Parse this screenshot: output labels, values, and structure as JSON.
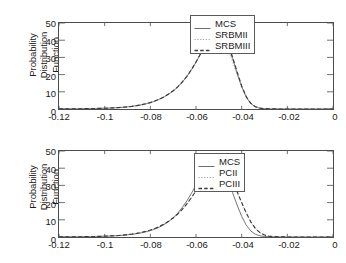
{
  "figure": {
    "background": "#ffffff",
    "axis_color": "#4d4d4d",
    "text_color": "#1a1a1a"
  },
  "chart_data": [
    {
      "id": "top",
      "type": "line",
      "title": "",
      "xlabel": "",
      "ylabel": "Probability Distribution\nFunction",
      "xlim": [
        -0.12,
        0
      ],
      "ylim": [
        0,
        50
      ],
      "grid": false,
      "legend_position": "upper right",
      "xticks": [
        -0.12,
        -0.1,
        -0.08,
        -0.06,
        -0.04,
        -0.02,
        0
      ],
      "xtick_labels": [
        "-0.12",
        "-0.1",
        "-0.08",
        "-0.06",
        "-0.04",
        "-0.02",
        "0"
      ],
      "yticks": [
        0,
        10,
        20,
        30,
        40,
        50
      ],
      "ytick_labels": [
        "0",
        "10",
        "20",
        "30",
        "40",
        "50"
      ],
      "x": [
        -0.12,
        -0.118,
        -0.116,
        -0.114,
        -0.112,
        -0.11,
        -0.108,
        -0.106,
        -0.104,
        -0.102,
        -0.1,
        -0.098,
        -0.096,
        -0.094,
        -0.092,
        -0.09,
        -0.088,
        -0.086,
        -0.084,
        -0.082,
        -0.08,
        -0.078,
        -0.076,
        -0.074,
        -0.072,
        -0.07,
        -0.068,
        -0.066,
        -0.064,
        -0.062,
        -0.06,
        -0.058,
        -0.056,
        -0.054,
        -0.052,
        -0.05,
        -0.048,
        -0.046,
        -0.044,
        -0.042,
        -0.04,
        -0.038,
        -0.036,
        -0.034,
        -0.032,
        -0.03,
        -0.028,
        -0.026,
        -0.024,
        -0.022,
        -0.02,
        -0.018,
        -0.016,
        -0.014,
        -0.012,
        -0.01,
        -0.008,
        -0.006,
        -0.004,
        -0.002,
        0
      ],
      "series": [
        {
          "name": "MCS",
          "style": "solid",
          "color": "#6e6e6e",
          "values": [
            0.05,
            0.06,
            0.08,
            0.1,
            0.13,
            0.16,
            0.2,
            0.25,
            0.3,
            0.37,
            0.45,
            0.55,
            0.67,
            0.82,
            1.0,
            1.25,
            1.55,
            1.95,
            2.4,
            3.0,
            3.7,
            4.6,
            5.7,
            7.0,
            8.6,
            10.5,
            12.8,
            15.6,
            18.9,
            22.8,
            27.2,
            32.0,
            36.8,
            41.0,
            43.6,
            44.0,
            42.0,
            37.0,
            29.5,
            21.0,
            13.0,
            7.0,
            3.2,
            1.3,
            0.5,
            0.2,
            0.08,
            0.04,
            0.02,
            0.01,
            0.01,
            0.0,
            0.0,
            0.0,
            0.0,
            0.0,
            0.0,
            0.0,
            0.0,
            0.0,
            0.0
          ]
        },
        {
          "name": "SRBMII",
          "style": "dotted",
          "color": "#a0a0a0",
          "values": [
            0.05,
            0.06,
            0.08,
            0.1,
            0.13,
            0.16,
            0.2,
            0.25,
            0.31,
            0.38,
            0.46,
            0.56,
            0.69,
            0.84,
            1.03,
            1.28,
            1.59,
            1.99,
            2.46,
            3.06,
            3.78,
            4.7,
            5.82,
            7.15,
            8.78,
            10.7,
            13.05,
            15.9,
            19.25,
            23.2,
            27.6,
            32.3,
            36.9,
            40.5,
            42.4,
            42.2,
            39.6,
            34.6,
            27.6,
            19.8,
            12.3,
            6.7,
            3.1,
            1.25,
            0.48,
            0.19,
            0.08,
            0.04,
            0.02,
            0.01,
            0.01,
            0.0,
            0.0,
            0.0,
            0.0,
            0.0,
            0.0,
            0.0,
            0.0,
            0.0,
            0.0
          ]
        },
        {
          "name": "SRBMIII",
          "style": "dashed",
          "color": "#3a3a3a",
          "values": [
            0.05,
            0.06,
            0.08,
            0.1,
            0.13,
            0.16,
            0.2,
            0.25,
            0.3,
            0.37,
            0.45,
            0.55,
            0.67,
            0.83,
            1.01,
            1.26,
            1.56,
            1.96,
            2.42,
            3.02,
            3.73,
            4.64,
            5.74,
            7.05,
            8.66,
            10.6,
            12.9,
            15.7,
            19.0,
            22.9,
            27.3,
            32.1,
            36.9,
            41.2,
            43.8,
            44.2,
            42.4,
            37.6,
            30.2,
            21.6,
            13.4,
            7.2,
            3.3,
            1.35,
            0.52,
            0.21,
            0.09,
            0.04,
            0.02,
            0.01,
            0.01,
            0.0,
            0.0,
            0.0,
            0.0,
            0.0,
            0.0,
            0.0,
            0.0,
            0.0,
            0.0
          ]
        }
      ]
    },
    {
      "id": "bottom",
      "type": "line",
      "title": "",
      "xlabel": "",
      "ylabel": "Probability Distribution\nFunction",
      "xlim": [
        -0.12,
        0
      ],
      "ylim": [
        0,
        50
      ],
      "grid": false,
      "legend_position": "upper right",
      "xticks": [
        -0.12,
        -0.1,
        -0.08,
        -0.06,
        -0.04,
        -0.02,
        0
      ],
      "xtick_labels": [
        "-0.12",
        "-0.1",
        "-0.08",
        "-0.06",
        "-0.04",
        "-0.02",
        "0"
      ],
      "yticks": [
        0,
        10,
        20,
        30,
        40,
        50
      ],
      "ytick_labels": [
        "0",
        "10",
        "20",
        "30",
        "40",
        "50"
      ],
      "x": [
        -0.12,
        -0.118,
        -0.116,
        -0.114,
        -0.112,
        -0.11,
        -0.108,
        -0.106,
        -0.104,
        -0.102,
        -0.1,
        -0.098,
        -0.096,
        -0.094,
        -0.092,
        -0.09,
        -0.088,
        -0.086,
        -0.084,
        -0.082,
        -0.08,
        -0.078,
        -0.076,
        -0.074,
        -0.072,
        -0.07,
        -0.068,
        -0.066,
        -0.064,
        -0.062,
        -0.06,
        -0.058,
        -0.056,
        -0.054,
        -0.052,
        -0.05,
        -0.048,
        -0.046,
        -0.044,
        -0.042,
        -0.04,
        -0.038,
        -0.036,
        -0.034,
        -0.032,
        -0.03,
        -0.028,
        -0.026,
        -0.024,
        -0.022,
        -0.02,
        -0.018,
        -0.016,
        -0.014,
        -0.012,
        -0.01,
        -0.008,
        -0.006,
        -0.004,
        -0.002,
        0
      ],
      "series": [
        {
          "name": "MCS",
          "style": "solid",
          "color": "#6e6e6e",
          "values": [
            0.05,
            0.06,
            0.08,
            0.1,
            0.13,
            0.16,
            0.2,
            0.25,
            0.3,
            0.37,
            0.45,
            0.55,
            0.67,
            0.82,
            1.0,
            1.25,
            1.55,
            1.95,
            2.4,
            3.0,
            3.7,
            4.6,
            5.8,
            7.2,
            9.0,
            11.2,
            13.9,
            17.2,
            21.0,
            25.4,
            30.2,
            35.0,
            39.3,
            42.1,
            43.0,
            41.6,
            38.0,
            32.6,
            25.8,
            18.6,
            12.0,
            6.9,
            3.5,
            1.6,
            0.7,
            0.3,
            0.12,
            0.06,
            0.03,
            0.02,
            0.01,
            0.01,
            0.0,
            0.0,
            0.0,
            0.0,
            0.0,
            0.0,
            0.0,
            0.0,
            0.0
          ]
        },
        {
          "name": "PCII",
          "style": "dotted",
          "color": "#a0a0a0",
          "values": [
            0.05,
            0.06,
            0.08,
            0.11,
            0.14,
            0.17,
            0.21,
            0.26,
            0.32,
            0.4,
            0.49,
            0.6,
            0.73,
            0.9,
            1.1,
            1.37,
            1.7,
            2.12,
            2.62,
            3.25,
            4.0,
            4.95,
            6.1,
            7.45,
            9.1,
            11.0,
            13.3,
            16.0,
            19.2,
            22.8,
            26.8,
            31.0,
            34.9,
            38.0,
            39.9,
            40.3,
            39.2,
            36.4,
            32.0,
            26.2,
            19.8,
            13.8,
            8.7,
            4.9,
            2.5,
            1.15,
            0.48,
            0.2,
            0.09,
            0.05,
            0.03,
            0.02,
            0.02,
            0.01,
            0.01,
            0.01,
            0.0,
            0.0,
            0.0,
            0.0,
            0.0
          ]
        },
        {
          "name": "PCIII",
          "style": "dashed",
          "color": "#3a3a3a",
          "values": [
            0.05,
            0.06,
            0.08,
            0.11,
            0.14,
            0.17,
            0.21,
            0.26,
            0.32,
            0.4,
            0.49,
            0.6,
            0.73,
            0.9,
            1.11,
            1.38,
            1.71,
            2.13,
            2.64,
            3.27,
            4.03,
            4.98,
            6.14,
            7.5,
            9.15,
            11.07,
            13.4,
            16.1,
            19.3,
            22.9,
            26.9,
            31.1,
            35.0,
            38.1,
            40.0,
            40.4,
            39.3,
            36.6,
            32.2,
            26.4,
            20.0,
            14.0,
            8.8,
            5.0,
            2.55,
            1.18,
            0.5,
            0.21,
            0.1,
            0.05,
            0.03,
            0.02,
            0.02,
            0.01,
            0.01,
            0.01,
            0.0,
            0.0,
            0.0,
            0.0,
            0.0
          ]
        }
      ]
    }
  ]
}
